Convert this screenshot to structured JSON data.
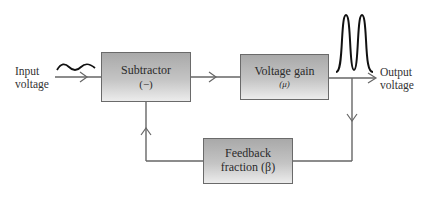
{
  "diagram": {
    "input": {
      "label_line1": "Input",
      "label_line2": "voltage",
      "signal": "small-sine-wave"
    },
    "output": {
      "label_line1": "Output",
      "label_line2": "voltage",
      "signal": "large-double-pulse"
    },
    "blocks": {
      "subtractor": {
        "title": "Subtractor",
        "symbol": "(−)"
      },
      "voltage_gain": {
        "title": "Voltage gain",
        "symbol": "(μ)"
      },
      "feedback": {
        "title": "Feedback",
        "symbol": "fraction (β)"
      }
    },
    "colors": {
      "line": "#666666",
      "box_top": "#a9a9a9",
      "box_bottom": "#ececec",
      "signal": "#111111"
    }
  }
}
